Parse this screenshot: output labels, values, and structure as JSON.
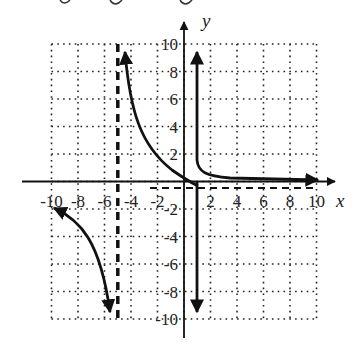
{
  "chart_data": {
    "type": "line",
    "title": "",
    "xlabel": "x",
    "ylabel": "y",
    "xlim": [
      -10,
      10
    ],
    "ylim": [
      -10,
      10
    ],
    "grid": true,
    "grid_style": "dotted",
    "x_ticks": [
      -10,
      -8,
      -6,
      -4,
      -2,
      2,
      4,
      6,
      8,
      10
    ],
    "y_ticks": [
      10,
      8,
      6,
      4,
      2,
      -2,
      -4,
      -6,
      -8,
      -10
    ],
    "x_tick_labels": [
      "-10",
      "-8",
      "-6",
      "-4",
      "-2",
      "2",
      "4",
      "6",
      "8",
      "10"
    ],
    "y_tick_labels": [
      "10",
      "8",
      "6",
      "4",
      "2",
      "-2",
      "-4",
      "-6",
      "-8",
      "-10"
    ],
    "asymptotes": [
      {
        "type": "vertical",
        "x": -5,
        "style": "dashed"
      },
      {
        "type": "horizontal",
        "y": -0.5,
        "style": "dashed"
      }
    ],
    "series": [
      {
        "name": "left-branch",
        "points": [
          [
            -10,
            -2
          ],
          [
            -8,
            -3
          ],
          [
            -7,
            -4.5
          ],
          [
            -6,
            -7
          ],
          [
            -5.5,
            -9.5
          ]
        ],
        "arrows": "both"
      },
      {
        "name": "middle-branch",
        "points": [
          [
            -4.5,
            9.5
          ],
          [
            -4,
            6
          ],
          [
            -3,
            3.2
          ],
          [
            -2,
            1.6
          ],
          [
            -1,
            0.6
          ],
          [
            0,
            0
          ],
          [
            1,
            -0.4
          ]
        ],
        "arrows": "start"
      },
      {
        "name": "right-branch",
        "points": [
          [
            1,
            9.5
          ],
          [
            1,
            5
          ],
          [
            1,
            2
          ],
          [
            1.3,
            0.7
          ],
          [
            2,
            0.4
          ],
          [
            4,
            0.15
          ],
          [
            6,
            0.05
          ],
          [
            10,
            0
          ]
        ],
        "arrows": "both"
      },
      {
        "name": "right-vertical-down",
        "points": [
          [
            1,
            0
          ],
          [
            1,
            -9.5
          ]
        ],
        "arrows": "end"
      }
    ]
  },
  "labels": {
    "x_axis": "x",
    "y_axis": "y",
    "xticks": [
      "-10",
      "-8",
      "-6",
      "-4",
      "-2",
      "2",
      "4",
      "6",
      "8",
      "10"
    ],
    "yticks": [
      "10",
      "8",
      "6",
      "4",
      "2",
      "-2",
      "-4",
      "-6",
      "-8",
      "-10"
    ]
  }
}
